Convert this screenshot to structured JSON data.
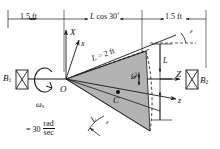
{
  "figure": {
    "colors": {
      "line": "#1a1a1a",
      "disk_fill": "#b3b3b3",
      "disk_edge": "#2b2b2b",
      "background": "#ffffff"
    }
  },
  "dimensions": {
    "left": "1.5 ft",
    "middle_value": "L",
    "middle_op": " cos 30",
    "middle_deg": "°",
    "right": "1.5 ft"
  },
  "bearings": {
    "left": {
      "base": "B",
      "sub": "1"
    },
    "right": {
      "base": "B",
      "sub": "2"
    }
  },
  "axes": {
    "X_upper": "X",
    "x_lower": "x",
    "Z_upper": "Z",
    "z_lower": "z",
    "origin": "O"
  },
  "labels": {
    "rod_length": {
      "base": "L",
      "eq": " = 2 ft"
    },
    "disk": "𝒟",
    "mass_center": "C",
    "height_L": "L",
    "height_L_bottom": "L",
    "epsilon_top": "ε",
    "epsilon_mid": "ε",
    "epsilon_bottom": "ε"
  },
  "omega": {
    "symbol": "ω",
    "sub": "0",
    "equals": "= 30",
    "num": "rad",
    "den": "sec"
  }
}
